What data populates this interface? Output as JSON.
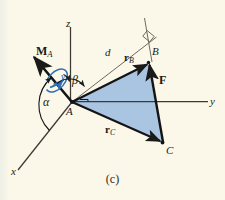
{
  "figure": {
    "caption": "(c)",
    "background_color": "#fbf8e9",
    "plane_fill_color": "#a9c5e2",
    "moment_arrow_color": "#2f6fb5",
    "line_color": "#1a1a18",
    "axes": {
      "z_label": "z",
      "y_label": "y",
      "x_label": "x"
    },
    "points": {
      "A": "A",
      "B": "B",
      "C": "C"
    },
    "vectors": {
      "moment": {
        "symbol": "M",
        "subscript": "A"
      },
      "r_B": {
        "symbol": "r",
        "subscript": "B"
      },
      "r_C": {
        "symbol": "r",
        "subscript": "C"
      },
      "force": {
        "symbol": "F",
        "subscript": ""
      }
    },
    "angles": {
      "alpha": "α",
      "beta": "β",
      "gamma": "γ"
    },
    "distance": {
      "label": "d"
    },
    "markers": {
      "right_angle": "right-angle",
      "rotation_sense": "double-headed-curl"
    }
  }
}
